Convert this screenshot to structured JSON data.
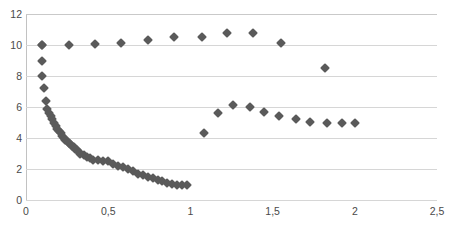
{
  "chart": {
    "title": "",
    "subtitle": "",
    "marker_color": "#5a5a5a",
    "grid_color": "#d6d6d6",
    "axis_color": "#c2c2c2",
    "background": "#ffffff"
  },
  "axes": {
    "y_tick_labels": [
      "12",
      "10",
      "8",
      "6",
      "4",
      "2",
      "0"
    ],
    "x_tick_labels": [
      "0",
      "0,5",
      "1",
      "1,5",
      "2",
      "2,5"
    ],
    "decimal_separator": ","
  },
  "chart_data": {
    "type": "scatter",
    "title": "",
    "xlabel": "",
    "ylabel": "",
    "xlim": [
      0,
      2.5
    ],
    "ylim": [
      0,
      12
    ],
    "xticks": [
      0,
      0.5,
      1,
      1.5,
      2,
      2.5
    ],
    "yticks": [
      0,
      2,
      4,
      6,
      8,
      10,
      12
    ],
    "xtick_labels": [
      "0",
      "0,5",
      "1",
      "1,5",
      "2",
      "2,5"
    ],
    "ytick_labels": [
      "0",
      "2",
      "4",
      "6",
      "8",
      "10",
      "12"
    ],
    "grid": true,
    "grid_axis": "y",
    "legend": false,
    "marker": "diamond",
    "marker_color": "#5a5a5a",
    "series": [
      {
        "name": "upper-branch",
        "points": [
          [
            0.1,
            10.0
          ],
          [
            0.26,
            10.0
          ],
          [
            0.42,
            10.05
          ],
          [
            0.58,
            10.1
          ],
          [
            0.74,
            10.35
          ],
          [
            0.9,
            10.5
          ],
          [
            1.07,
            10.5
          ],
          [
            1.22,
            10.75
          ],
          [
            1.38,
            10.75
          ],
          [
            1.55,
            10.15
          ],
          [
            1.82,
            8.5
          ]
        ]
      },
      {
        "name": "middle-branch",
        "points": [
          [
            1.08,
            4.3
          ],
          [
            1.17,
            5.6
          ],
          [
            1.26,
            6.1
          ],
          [
            1.36,
            6.0
          ],
          [
            1.45,
            5.65
          ],
          [
            1.54,
            5.4
          ],
          [
            1.64,
            5.2
          ],
          [
            1.73,
            5.05
          ],
          [
            1.83,
            5.0
          ],
          [
            1.92,
            5.0
          ],
          [
            2.0,
            5.0
          ]
        ]
      },
      {
        "name": "decay-branch",
        "points": [
          [
            0.1,
            10.0
          ],
          [
            0.1,
            9.0
          ],
          [
            0.1,
            8.0
          ],
          [
            0.11,
            7.2
          ],
          [
            0.12,
            6.4
          ],
          [
            0.13,
            5.9
          ],
          [
            0.14,
            5.6
          ],
          [
            0.15,
            5.4
          ],
          [
            0.16,
            5.2
          ],
          [
            0.17,
            5.0
          ],
          [
            0.18,
            4.8
          ],
          [
            0.19,
            4.6
          ],
          [
            0.2,
            4.45
          ],
          [
            0.21,
            4.3
          ],
          [
            0.22,
            4.15
          ],
          [
            0.23,
            4.0
          ],
          [
            0.24,
            3.9
          ],
          [
            0.25,
            3.8
          ],
          [
            0.26,
            3.7
          ],
          [
            0.27,
            3.6
          ],
          [
            0.28,
            3.5
          ],
          [
            0.29,
            3.4
          ],
          [
            0.3,
            3.3
          ],
          [
            0.31,
            3.2
          ],
          [
            0.32,
            3.1
          ],
          [
            0.33,
            3.0
          ],
          [
            0.35,
            2.9
          ],
          [
            0.37,
            2.8
          ],
          [
            0.39,
            2.7
          ],
          [
            0.41,
            2.6
          ],
          [
            0.44,
            2.55
          ],
          [
            0.47,
            2.5
          ],
          [
            0.5,
            2.5
          ],
          [
            0.53,
            2.3
          ],
          [
            0.56,
            2.2
          ],
          [
            0.59,
            2.1
          ],
          [
            0.62,
            2.0
          ],
          [
            0.65,
            1.85
          ],
          [
            0.68,
            1.7
          ],
          [
            0.71,
            1.6
          ],
          [
            0.74,
            1.5
          ],
          [
            0.77,
            1.4
          ],
          [
            0.8,
            1.3
          ],
          [
            0.83,
            1.2
          ],
          [
            0.86,
            1.1
          ],
          [
            0.89,
            1.05
          ],
          [
            0.92,
            1.0
          ],
          [
            0.95,
            1.0
          ],
          [
            0.98,
            1.0
          ]
        ]
      }
    ]
  }
}
